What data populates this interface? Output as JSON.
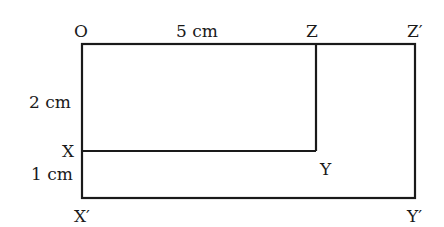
{
  "diagram": {
    "type": "geometry-rectangles",
    "stroke_color": "#1a1a1a",
    "points": {
      "O": "O",
      "Z": "Z",
      "Z_prime": "Z′",
      "X": "X",
      "Y": "Y",
      "X_prime": "X′",
      "Y_prime": "Y′"
    },
    "measurements": {
      "OZ": "5 cm",
      "OX": "2 cm",
      "XX_prime": "1 cm"
    },
    "shapes": [
      {
        "name": "rectangle OZYX",
        "vertices": [
          "O",
          "Z",
          "Y",
          "X"
        ]
      },
      {
        "name": "rectangle OZ′Y′X′",
        "vertices": [
          "O",
          "Z′",
          "Y′",
          "X′"
        ]
      }
    ]
  }
}
